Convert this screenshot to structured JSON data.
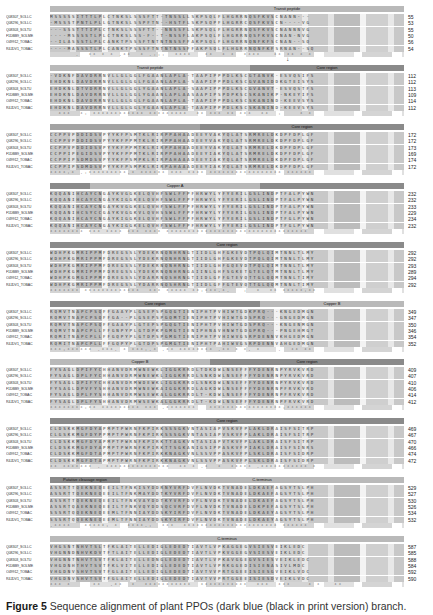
{
  "figure": {
    "caption_label": "Figure 5",
    "caption_text": " Sequence alignment of plant PPOs (dark blue (black in print version) branch."
  },
  "sequence_names": [
    "Q08307_SOLLC",
    "Q08296_SOLLC",
    "Q08303_SOLTU",
    "F1DBB9_SOLME",
    "O49912_TOBAC",
    "R4JDV1_TOBAC"
  ],
  "blocks": [
    {
      "regions": [
        {
          "label": "",
          "width": 120,
          "tone": "light"
        },
        {
          "label": "Transit peptide",
          "width": 234,
          "tone": "light"
        }
      ],
      "rows": [
        {
          "seq": "MSSSSSITTTLPLCTNKSLSSSFTT-TNSSLLSKPSQLFLHGRRNQSFKVSCNANN---",
          "end": "55"
        },
        {
          "seq": "-MSSSTPNTLPLLGTNKSLSSPFTN--HSTFLSKPSQPFLHGRRCQSFKVSCN----VG",
          "end": "53"
        },
        {
          "seq": "---SSSTTTIPLCTNKSLSSSFTT--NNSSFLSKPSQLFLHGRRNQSFKVSCNANNNVG",
          "end": "55"
        },
        {
          "seq": "----MSSSSTLPLCTNKSLSS-F--T-NSSFLAKPSQLFLHGRRNQSFKVSCNAN-NVG",
          "end": "50"
        },
        {
          "seq": "--ILASSSTLPLCANKTPSSSFTNTNTNSSFFAKPSQLFLHGRRNQNFKFSCNAN--SQ",
          "end": "56"
        },
        {
          "seq": "----MASSSTLPLCANKTPSSSFTNTNTNSSFFAKPSQLFLHGRRNQNFKFSRNAN--SQ",
          "end": "54"
        }
      ],
      "consensus": "      .  ** * * .**  * .:::  ****   **  * *  ****   ** ** * *",
      "arrow_offset": 139
    },
    {
      "regions": [
        {
          "label": "Transit peptide",
          "width": 200,
          "tone": "light"
        },
        {
          "label": "Core region",
          "width": 154,
          "tone": "dark"
        }
      ],
      "rows": [
        {
          "seq": "-VDKNFDAVDRRNVLLGLGGLFGAANLAPLA-TAAPIPPPDLKSCGTANVK-ESVQSIFS",
          "end": "112"
        },
        {
          "seq": "EHDKNLDAVDRRNVLLGLGGLFGAANLAPLA-SAAPIPPPDLKSCGVANIDDKGTEISYS",
          "end": "112"
        },
        {
          "seq": "EHDKNLDTVDRRNVLLGLGGLYGAANLAPLA-SAAPIPPPDLKSCGVANVT-ESVQSTFS",
          "end": "113"
        },
        {
          "seq": "EHDKNLDAVDRRNVLLGLGGLYGAANLAPLAASAAPIPSPDPKSCSKANIKP-NKEYIFS",
          "end": "109"
        },
        {
          "seq": "EHDKNLDAVDRRNVLLGLGGLFGAANLAPLA-TAAPIPPPDLKSCSKANIND-KEEVSYS",
          "end": "114"
        },
        {
          "seq": "EHDKNLDAVDRRNVLLGLGGLYGAANLAPLA-TAAPIPPPDLKSCSKANIND-KEEVSYS",
          "end": "112"
        }
      ],
      "consensus": "  ***  *: ************ *********  ** *** ** ***  **  :    * *"
    },
    {
      "regions": [
        {
          "label": "",
          "width": 150,
          "tone": "mid"
        },
        {
          "label": "Core region",
          "width": 204,
          "tone": "dark"
        }
      ],
      "rows": [
        {
          "seq": "CCPPVPDDIDSVPYYKFPSMTKLRIRPPAHAADEEYVAKYQLATSRMRELDKDPFDPLGF",
          "end": "172"
        },
        {
          "seq": "CCPPVPDDIDSVPYYKFPPMTKLRIRPPAHAADEEYVAKYQLATSRMRELDKDPFDPLGF",
          "end": "172"
        },
        {
          "seq": "CCPPVPDDIDSVPYYKFPPMTKLRIRPPAHAADEEYVAKYQLATSRMRELDKDPFDPLGF",
          "end": "173"
        },
        {
          "seq": "CCPPIPEGIDSVPYYKFPPMTKLRIRPPAHAADEEYIAKYQLATSRMRELDKDPFDPLGF",
          "end": "169"
        },
        {
          "seq": "CCPPIPSDMDSVPYYKFPSMPKLRIRPAHAAADEEYIAKYQLATSRMRELDKDPFDPLGF",
          "end": "174"
        },
        {
          "seq": "CCPPIPSDMDSVPYYKFPSMPKLRIRPAHAAADEEYIAKYQLATSRMRELDKDPFDPLGF",
          "end": "172"
        }
      ],
      "consensus": "****:* .:*********.* ****** *** **** ***************** ******"
    },
    {
      "regions": [
        {
          "label": "",
          "width": 40,
          "tone": "dark"
        },
        {
          "label": "Copper A",
          "width": 170,
          "tone": "light"
        },
        {
          "label": "",
          "width": 144,
          "tone": "dark"
        }
      ],
      "rows": [
        {
          "seq": "KQQANIHCAYCNGAYKVGGKELQVHFSWLFFPFHRWYLYFYERILGSLINDPTFALPYWN",
          "end": "232"
        },
        {
          "seq": "KQQANIHCAYCNGAYKIGGKELQVHFSWLFFPFHRWYLYFYERILGSLINDPTFALPYWN",
          "end": "232"
        },
        {
          "seq": "KQQANIHCAYCNGAYKVGGKELQVHFSWLFFPFHRWYLYFYERILGSLINDPTFALPYWN",
          "end": "233"
        },
        {
          "seq": "KQQANIHCSYCCGAYKVGGKVLQVHSSWLFFPFHRWYLYFYERILGSLINDPTFALPYWN",
          "end": "229"
        },
        {
          "seq": "KQQANIHCAYCNGAYKIGGKELQVHFSWLFFPFHRWYLYFYERILGSLINDPTFGLPYWN",
          "end": "234"
        },
        {
          "seq": "KQQANIHCAYCNGAYKIGGKELQVHFSWLFFPFHRWYLYFYERILGSLINDPTFGLPYWN",
          "end": "232"
        }
      ],
      "consensus": "******** *** **** *** **** ********************************* "
    },
    {
      "regions": [
        {
          "label": "Core region",
          "width": 354,
          "tone": "dark"
        }
      ],
      "rows": [
        {
          "seq": "WDHPKGMRIPPMFDREGSSLYDEKRNQNHRNGTIIDLGHFGKEVDTPQLQIMTNNLTLMY",
          "end": "292"
        },
        {
          "seq": "WDHPKGMRIPPMFDREGSSLYDEKRNQNHRNGTIIDLGHFGKEVDTPQLQIMTNNLTLMY",
          "end": "292"
        },
        {
          "seq": "WDHPKGMRIPPMFDREGSSLYDEKRNQNHRNGTIIDLGHFGQEVDTPQLQIMTNNLTLMY",
          "end": "293"
        },
        {
          "seq": "WDHPKGMRIPPMFDREGSSLYDEKRNQNHRNGAIINLGHFSGKETGTELQTMTNNLTLMY",
          "end": "289"
        },
        {
          "seq": "WDHPKGMGIPPMFDREGSSLYDARRNQSHRNGTIIDLGFFGTEVQTTGLQQMTNNLTIMY",
          "end": "294"
        },
        {
          "seq": "WDHPKGMRIPPMFDREGSSLYDARRNQSHRNGTIIDLGFFGTEVQTTGLQQMTNNLTIMY",
          "end": "292"
        }
      ],
      "consensus": "******* *************  *** ***** **:***.*.   :  *  ** *****:**"
    },
    {
      "regions": [
        {
          "label": "Core region",
          "width": 210,
          "tone": "dark"
        },
        {
          "label": "Copper B",
          "width": 144,
          "tone": "light"
        }
      ],
      "rows": [
        {
          "seq": "RQMVTNAPCPSQFFGAAYPLGSEPSPGQGTIENIPHTPVHIWTGDKPRQ---KNGEDMGN",
          "end": "349"
        },
        {
          "seq": "RQMVTNAPCPSQFFGA--PLGSEPSPGQMTIENIPHTPVHIWTGDSPRQ---GNGEDMGN",
          "end": "347"
        },
        {
          "seq": "RQMVTNAPCPSQFFGAAYPLGTEPSPGQGTIENIPHTPVHIWTGDSPRQ---KNGENMGN",
          "end": "350"
        },
        {
          "seq": "RQMVTNAPCPLLFFGNPYPLGTDPKPGMGTIENIPHNAVHNWTGDGPRQ---PNGEHMGT",
          "end": "346"
        },
        {
          "seq": "RQMITNAPCPLLFFGQPYPLGTDPSPGMGTIENIPHTPVHIWVGSRPDENNVKHGEDMGN",
          "end": "354"
        },
        {
          "seq": "RQMITNAPCPLLFFGQPYPLGTDPSPGMGTIENIPHTPAHIWVGSRPDENNVAHGEDMGN",
          "end": "352"
        }
      ],
      "consensus": "***:****** .***. * ***:.* .** ******** .** * *. *    .  ** ** "
    },
    {
      "regions": [
        {
          "label": "",
          "width": 20,
          "tone": "light"
        },
        {
          "label": "Copper B",
          "width": 140,
          "tone": "light"
        },
        {
          "label": "Core region",
          "width": 194,
          "tone": "dark"
        }
      ],
      "rows": [
        {
          "seq": "FYSAGLDPIFYCHHANVDRMWNEWKLIGGKRRDLTDKDWLNSEFFFYDENRNPYRVKVRD",
          "end": "409"
        },
        {
          "seq": "FYSAGLDPLFYCHHANVDRMWNEWKLIGGKRRDLSNKDWLNSEFFFYDENRNPYRVKVRD",
          "end": "407"
        },
        {
          "seq": "FYSAGLDPIFYCHHANVDRMWDEWKLIGGKRRDLSNKDWLNSEFFFYDENRNPYRVKVRD",
          "end": "410"
        },
        {
          "seq": "FYSAGLDPVFYSHHANVDRMWNEWKAIGGKRRDLAGKDWLNSEFFFYDENRNPFRVKVRD",
          "end": "406"
        },
        {
          "seq": "FYSAGLDPLFYSHHANVDRMWSEWKALGGKRRDLT-KDWLNSEFFFYDENRNPFRVKVRD",
          "end": "414"
        },
        {
          "seq": "FYSAGLDPLFYSHHANVDRMWSEWKALGGKRRDLT-KDWLNSEFFFYDENRNPFRVKVRD",
          "end": "412"
        }
      ],
      "consensus": "********:** ********* *** .*******   *****************:******"
    },
    {
      "regions": [
        {
          "label": "Core region",
          "width": 354,
          "tone": "dark"
        }
      ],
      "rows": [
        {
          "seq": "CLDSKKMGFDYAPMPTPWRNFKPIRKSSSGKVNTASIAPVSKVFPLAKLDRAISFSITRP",
          "end": "469"
        },
        {
          "seq": "CLGSKKMGFDYPPMPTPWRNFKPIRKSSSGKVNTASIAPVSKVFPLAKLDRAISFSITRP",
          "end": "467"
        },
        {
          "seq": "CLDSKKMGFDYAPMPTPWRNFKPIRKTTAGKVNTASIAPVTKVFPLAKLDRAISFSITRP",
          "end": "470"
        },
        {
          "seq": "CLDSKKMGFDYAPMPTPWRNFKPIRKTTSGKANIGSIPPASKVFPIAKLDRAISFSINRS",
          "end": "466"
        },
        {
          "seq": "CLDSKKMGFDTAPMPTPWRNFKPIRKKNAGKVNLSSVPPASKVFPLSKLDRAISFSIDRP",
          "end": "474"
        },
        {
          "seq": "CLDSKKMGFDTAPMPTPWRNFKPIRKKNAGKVNLSSVPPASKVFPLSKLDRAISFSIDRP",
          "end": "472"
        }
      ],
      "consensus": "** ******* . ***************  ** * .*  *  ***** .*********** * "
    },
    {
      "regions": [
        {
          "label": "Putative cleavage region",
          "width": 70,
          "tone": "dark"
        },
        {
          "label": "C-terminus",
          "width": 284,
          "tone": "light"
        }
      ],
      "rows": [
        {
          "seq": "ASSRTTQEKNEQEEILTFNKISYDDRNYVRFDVFLNVDKTVNADELDKAEFAGSYTSLPH",
          "end": "529"
        },
        {
          "seq": "ASSRTTQEKNEQEEILTFNKMAYDDTKYVRFDVFLNVDKTVNADELDKAEFAGSYTSLPH",
          "end": "527"
        },
        {
          "seq": "ASSRTTQEKNEQEEILTFNKVAYDDTKYVRFDVFLNVDKTVNADELDKAEFAGSYTSLPH",
          "end": "530"
        },
        {
          "seq": "ASSRTQAEKNEQEEILTFNKVQYDDSQCVRFDVFLNVDKTVNADELDKPEFAGSYTSLPH",
          "end": "526"
        },
        {
          "seq": "SSSRTQQEKNEQEEMLTFNNIAYDDSKYIRFDVFLNVDKTVNADELDKAEYAGSYTSLPH",
          "end": "534"
        },
        {
          "seq": "SSSRTQQEKNEQEEMLTFNNIAYDDSKYIRFDVFLNVDKTVNADELDKAEYAGSYTSLPH",
          "end": "532"
        }
      ],
      "consensus": ".****   *****: *  ****.:  ***  ********************** ******"
    },
    {
      "regions": [
        {
          "label": "C-terminus",
          "width": 354,
          "tone": "light"
        }
      ],
      "rows": [
        {
          "seq": "VHGSNTNHVTSLTFKLAITELLEDIGLEDEDTIAVTLVPKAGGEGVSIESVEIKLEDC",
          "end": "587"
        },
        {
          "seq": "VHGNNDNHVKDVTFTLAITELLEDIGLEDEDTIAVTLVPKVGGEGVSIESVEIKLEDC",
          "end": "585"
        },
        {
          "seq": "VHGNNTNHVTSVTFKLAITELLEDNGLEDEDTIAVTLVPKAVGGEGVSIESVEIKLEDC",
          "end": "588"
        },
        {
          "seq": "VHGDNHTHVTSVTFKLVITELLEDIGLEDEDTIAVTLVPRKGGEDISIENASIVLMDC",
          "end": "584"
        },
        {
          "seq": "VHGDNVSHVTSVTFGLAITELLEDIGLEDEDTIAVTVVPRTGGEEISIESGVEIKLVDC",
          "end": "592"
        },
        {
          "seq": "VHGDNVSHVTSVTFGLAITELLEDIGLEDEDTIAVTVVPRTGGEEISIESDVEIKLVDC",
          "end": "590"
        }
      ],
      "consensus": "*** *     **  .**  *  ***********  ***********  ***  ***    * *   **"
    }
  ]
}
